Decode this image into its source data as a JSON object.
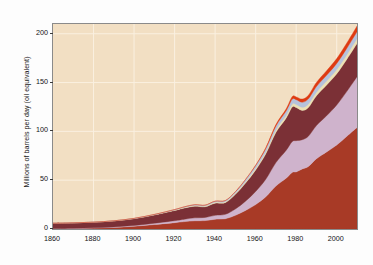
{
  "chart_data": {
    "type": "area",
    "title": "",
    "subtitle": "",
    "xlabel": "",
    "ylabel": "Millions of barrels per day (oil equivalent)",
    "xlim": [
      1860,
      2010
    ],
    "ylim": [
      0,
      210
    ],
    "yticks": [
      0,
      50,
      100,
      150,
      200
    ],
    "ytick_labels": [
      "0",
      "50",
      "100",
      "150",
      "200"
    ],
    "xticks": [
      1860,
      1880,
      1900,
      1920,
      1940,
      1960,
      1980,
      2000
    ],
    "xtick_labels": [
      "1860",
      "1880",
      "1900",
      "1920",
      "1940",
      "1960",
      "1980",
      "2000"
    ],
    "grid": true,
    "grid_color": "#faf0e0",
    "plot_background": "#f2dfc3",
    "figure_background": "#fdfdfd",
    "stacked": true,
    "legend": "none",
    "x": [
      1860,
      1870,
      1880,
      1890,
      1900,
      1910,
      1920,
      1925,
      1930,
      1935,
      1940,
      1945,
      1950,
      1955,
      1960,
      1965,
      1970,
      1975,
      1978,
      1980,
      1983,
      1986,
      1990,
      1995,
      2000,
      2005,
      2010
    ],
    "series": [
      {
        "name": "biomass",
        "color": "#a83a26",
        "values": [
          0.3,
          0.5,
          0.9,
          1.6,
          2.8,
          4.6,
          6.5,
          7.6,
          8.4,
          8.6,
          10.0,
          10.5,
          14.0,
          19.0,
          25.0,
          33.0,
          44.0,
          52.0,
          58.0,
          58.5,
          61.5,
          64.0,
          72.0,
          79.0,
          86.0,
          95.0,
          104.0
        ]
      },
      {
        "name": "coal",
        "color": "#cfb3cc",
        "values": [
          0.1,
          0.2,
          0.3,
          0.5,
          0.8,
          1.3,
          2.0,
          2.5,
          3.0,
          3.2,
          4.0,
          4.5,
          6.5,
          9.5,
          13.5,
          18.0,
          24.0,
          28.5,
          31.5,
          32.0,
          30.0,
          31.0,
          34.0,
          37.0,
          41.0,
          46.0,
          52.0
        ]
      },
      {
        "name": "oil",
        "color": "#7b3036",
        "values": [
          5.5,
          5.6,
          5.8,
          6.2,
          7.0,
          8.5,
          10.5,
          11.5,
          12.0,
          11.0,
          12.5,
          12.0,
          15.0,
          18.5,
          22.0,
          26.0,
          31.0,
          33.0,
          35.5,
          34.0,
          30.0,
          29.5,
          30.5,
          31.5,
          32.0,
          33.0,
          34.0
        ]
      },
      {
        "name": "hydro",
        "color": "#ece0b4",
        "values": [
          0.0,
          0.0,
          0.0,
          0.1,
          0.2,
          0.3,
          0.5,
          0.6,
          0.7,
          0.7,
          0.9,
          0.9,
          1.1,
          1.4,
          1.7,
          2.0,
          2.4,
          2.7,
          2.9,
          3.0,
          3.2,
          3.4,
          3.7,
          4.0,
          4.3,
          4.6,
          5.0
        ]
      },
      {
        "name": "gas",
        "color": "#b6c2dc",
        "values": [
          0.0,
          0.0,
          0.0,
          0.0,
          0.1,
          0.2,
          0.4,
          0.6,
          0.8,
          0.9,
          1.1,
          1.2,
          1.6,
          2.2,
          2.8,
          3.4,
          4.2,
          4.6,
          5.0,
          5.0,
          5.2,
          5.4,
          5.8,
          6.0,
          6.3,
          6.6,
          7.0
        ]
      },
      {
        "name": "nuclear",
        "color": "#de3a12",
        "values": [
          0.0,
          0.0,
          0.0,
          0.0,
          0.0,
          0.0,
          0.0,
          0.0,
          0.0,
          0.0,
          0.0,
          0.0,
          0.0,
          0.2,
          0.4,
          0.8,
          1.4,
          2.0,
          2.6,
          2.8,
          3.2,
          3.6,
          4.2,
          4.6,
          5.0,
          5.4,
          5.8
        ]
      }
    ],
    "total_2010": 207.8,
    "total_1860": 5.9
  },
  "axis": {
    "ylabel_text": "Millions of barrels per day (oil equivalent)"
  }
}
